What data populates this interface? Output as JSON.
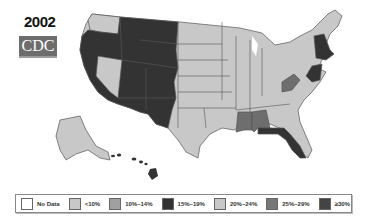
{
  "header": {
    "year": "2002",
    "logo_text": "CDC"
  },
  "colors": {
    "no_data": "#ffffff",
    "lt10": "#c8c8c8",
    "p10_14": "#a0a0a0",
    "p15_19": "#333333",
    "p20_24": "#c8c8c8",
    "p25_29": "#6e6e6e",
    "ge30": "#3a3a3a",
    "state_border": "#555555"
  },
  "legend": {
    "items": [
      {
        "label": "No Data",
        "color": "#ffffff"
      },
      {
        "label": "<10%",
        "color": "#c8c8c8"
      },
      {
        "label": "10%–14%",
        "color": "#a0a0a0"
      },
      {
        "label": "15%–19%",
        "color": "#333333"
      },
      {
        "label": "20%–24%",
        "color": "#c8c8c8"
      },
      {
        "label": "25%–29%",
        "color": "#777777"
      },
      {
        "label": "≥30%",
        "color": "#444444"
      }
    ]
  },
  "map": {
    "regions": [
      {
        "name": "Pacific & Mountain West (WA excluded, NV excluded)",
        "category": "15%–19%"
      },
      {
        "name": "Washington",
        "category": "20%–24%"
      },
      {
        "name": "Nevada",
        "category": "20%–24%"
      },
      {
        "name": "Central & Midwest states",
        "category": "20%–24%"
      },
      {
        "name": "Southern states",
        "category": "20%–24%"
      },
      {
        "name": "Mississippi",
        "category": "25%–29%"
      },
      {
        "name": "Alabama",
        "category": "25%–29%"
      },
      {
        "name": "West Virginia",
        "category": "25%–29%"
      },
      {
        "name": "Florida",
        "category": "15%–19%"
      },
      {
        "name": "New Hampshire / Vermont / New England",
        "category": "15%–19%"
      },
      {
        "name": "New Jersey / Delaware / Maryland",
        "category": "15%–19%"
      },
      {
        "name": "Alaska",
        "category": "20%–24%"
      },
      {
        "name": "Hawaii",
        "category": "15%–19%"
      }
    ]
  }
}
